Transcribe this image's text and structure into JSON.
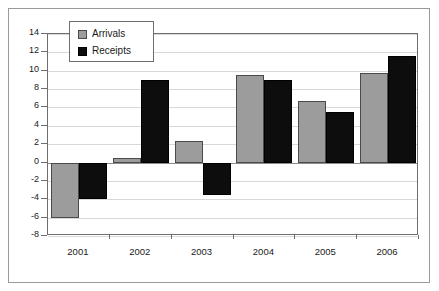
{
  "chart_data": {
    "type": "bar",
    "title": "",
    "subtitle": "",
    "xlabel": "",
    "ylabel": "",
    "categories": [
      "2001",
      "2002",
      "2003",
      "2004",
      "2005",
      "2006"
    ],
    "series": [
      {
        "name": "Arrivals",
        "color": "#9c9c9c",
        "values": [
          -6.0,
          0.5,
          2.4,
          9.5,
          6.7,
          9.7
        ]
      },
      {
        "name": "Receipts",
        "color": "#0d0d0d",
        "values": [
          -4.0,
          9.0,
          -3.5,
          9.0,
          5.5,
          11.6
        ]
      }
    ],
    "ylim": [
      -8,
      14
    ],
    "ytick_step": 2,
    "yticks": [
      "14",
      "12",
      "10",
      "8",
      "6",
      "4",
      "2",
      "0",
      "-2",
      "-4",
      "-6",
      "-8"
    ],
    "grid": true,
    "legend_position": "top-left-inside",
    "legend_entries": [
      "Arrivals",
      "Receipts"
    ]
  }
}
